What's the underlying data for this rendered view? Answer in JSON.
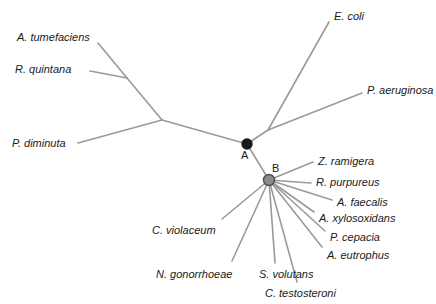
{
  "figure": {
    "name": "unrooted-phylogenetic-tree",
    "background_color": "#ffffff",
    "branch_color": "#9a9a9a",
    "text_color": "#1a1a1a",
    "width": 436,
    "height": 304
  },
  "chart_data": {
    "type": "diagram",
    "subtype": "unrooted-phylogenetic-tree",
    "title": "",
    "xlabel": "",
    "ylabel": "",
    "grid": false,
    "legend": "none",
    "branch_color": "#9a9a9a",
    "internal_nodes": [
      {
        "id": "root_left",
        "label": "",
        "x": 162,
        "y": 120,
        "marker": "none"
      },
      {
        "id": "upper_left_fork",
        "label": "",
        "x": 127,
        "y": 78,
        "marker": "none"
      },
      {
        "id": "A",
        "label": "A",
        "x": 247,
        "y": 144,
        "marker": "filled-black-circle",
        "radius": 5,
        "fill": "#1a1a1a",
        "stroke": "#1a1a1a",
        "label_x": 241,
        "label_y": 150
      },
      {
        "id": "EcPa_fork",
        "label": "",
        "x": 268,
        "y": 130,
        "marker": "none"
      },
      {
        "id": "B",
        "label": "B",
        "x": 269,
        "y": 180,
        "marker": "gray-circle",
        "radius": 5.5,
        "fill": "#8c8c8c",
        "stroke": "#4d4d4d",
        "label_x": 272,
        "label_y": 163
      }
    ],
    "leaves": [
      {
        "name": "A. tumefaciens",
        "label_x": 17,
        "label_y": 32,
        "anchor": "start",
        "tip_x": 98,
        "tip_y": 43,
        "parent": "upper_left_fork"
      },
      {
        "name": "R. quintana",
        "label_x": 15,
        "label_y": 64,
        "anchor": "start",
        "tip_x": 90,
        "tip_y": 71,
        "parent": "upper_left_fork"
      },
      {
        "name": "P. diminuta",
        "label_x": 12,
        "label_y": 138,
        "anchor": "start",
        "tip_x": 78,
        "tip_y": 143,
        "parent": "root_left"
      },
      {
        "name": "E. coli",
        "label_x": 334,
        "label_y": 11,
        "anchor": "start",
        "tip_x": 329,
        "tip_y": 22,
        "parent": "EcPa_fork"
      },
      {
        "name": "P. aeruginosa",
        "label_x": 367,
        "label_y": 85,
        "anchor": "start",
        "tip_x": 362,
        "tip_y": 93,
        "parent": "EcPa_fork"
      },
      {
        "name": "Z. ramigera",
        "label_x": 318,
        "label_y": 156,
        "anchor": "start",
        "tip_x": 313,
        "tip_y": 162,
        "parent": "B"
      },
      {
        "name": "R. purpureus",
        "label_x": 316,
        "label_y": 177,
        "anchor": "start",
        "tip_x": 311,
        "tip_y": 183,
        "parent": "B"
      },
      {
        "name": "A. faecalis",
        "label_x": 337,
        "label_y": 197,
        "anchor": "start",
        "tip_x": 332,
        "tip_y": 200,
        "parent": "B"
      },
      {
        "name": "A. xylosoxidans",
        "label_x": 319,
        "label_y": 213,
        "anchor": "start",
        "tip_x": 314,
        "tip_y": 212,
        "parent": "B"
      },
      {
        "name": "P. cepacia",
        "label_x": 330,
        "label_y": 232,
        "anchor": "start",
        "tip_x": 325,
        "tip_y": 231,
        "parent": "B"
      },
      {
        "name": "A. eutrophus",
        "label_x": 327,
        "label_y": 250,
        "anchor": "start",
        "tip_x": 322,
        "tip_y": 247,
        "parent": "B"
      },
      {
        "name": "C. testosteroni",
        "label_x": 265,
        "label_y": 288,
        "anchor": "start",
        "tip_x": 297,
        "tip_y": 282,
        "parent": "B"
      },
      {
        "name": "S. volutans",
        "label_x": 259,
        "label_y": 269,
        "anchor": "start",
        "tip_x": 275,
        "tip_y": 263,
        "parent": "B"
      },
      {
        "name": "N. gonorrhoeae",
        "label_x": 156,
        "label_y": 269,
        "anchor": "start",
        "tip_x": 232,
        "tip_y": 261,
        "parent": "B"
      },
      {
        "name": "C. violaceum",
        "label_x": 152,
        "label_y": 225,
        "anchor": "start",
        "tip_x": 222,
        "tip_y": 219,
        "parent": "B"
      }
    ],
    "edges": [
      {
        "from_x": 98,
        "from_y": 43,
        "to_x": 127,
        "to_y": 78,
        "name": "branch-a-tumefaciens"
      },
      {
        "from_x": 90,
        "from_y": 71,
        "to_x": 127,
        "to_y": 78,
        "name": "branch-r-quintana"
      },
      {
        "from_x": 127,
        "from_y": 78,
        "to_x": 162,
        "to_y": 120,
        "name": "branch-upper-left-internal"
      },
      {
        "from_x": 78,
        "from_y": 143,
        "to_x": 162,
        "to_y": 120,
        "name": "branch-p-diminuta"
      },
      {
        "from_x": 162,
        "from_y": 120,
        "to_x": 247,
        "to_y": 144,
        "name": "branch-root-to-a"
      },
      {
        "from_x": 247,
        "from_y": 144,
        "to_x": 268,
        "to_y": 130,
        "name": "branch-a-to-ecoli-fork"
      },
      {
        "from_x": 268,
        "from_y": 130,
        "to_x": 329,
        "to_y": 22,
        "name": "branch-e-coli"
      },
      {
        "from_x": 268,
        "from_y": 130,
        "to_x": 362,
        "to_y": 93,
        "name": "branch-p-aeruginosa"
      },
      {
        "from_x": 247,
        "from_y": 144,
        "to_x": 269,
        "to_y": 180,
        "name": "branch-a-to-b"
      },
      {
        "from_x": 269,
        "from_y": 180,
        "to_x": 313,
        "to_y": 162,
        "name": "branch-z-ramigera"
      },
      {
        "from_x": 269,
        "from_y": 180,
        "to_x": 311,
        "to_y": 183,
        "name": "branch-r-purpureus"
      },
      {
        "from_x": 269,
        "from_y": 180,
        "to_x": 332,
        "to_y": 200,
        "name": "branch-a-faecalis"
      },
      {
        "from_x": 269,
        "from_y": 180,
        "to_x": 314,
        "to_y": 212,
        "name": "branch-a-xylosoxidans"
      },
      {
        "from_x": 269,
        "from_y": 180,
        "to_x": 325,
        "to_y": 231,
        "name": "branch-p-cepacia"
      },
      {
        "from_x": 269,
        "from_y": 180,
        "to_x": 322,
        "to_y": 247,
        "name": "branch-a-eutrophus"
      },
      {
        "from_x": 269,
        "from_y": 180,
        "to_x": 297,
        "to_y": 282,
        "name": "branch-c-testosteroni"
      },
      {
        "from_x": 269,
        "from_y": 180,
        "to_x": 275,
        "to_y": 263,
        "name": "branch-s-volutans"
      },
      {
        "from_x": 269,
        "from_y": 180,
        "to_x": 232,
        "to_y": 261,
        "name": "branch-n-gonorrhoeae"
      },
      {
        "from_x": 269,
        "from_y": 180,
        "to_x": 222,
        "to_y": 219,
        "name": "branch-c-violaceum"
      }
    ]
  }
}
